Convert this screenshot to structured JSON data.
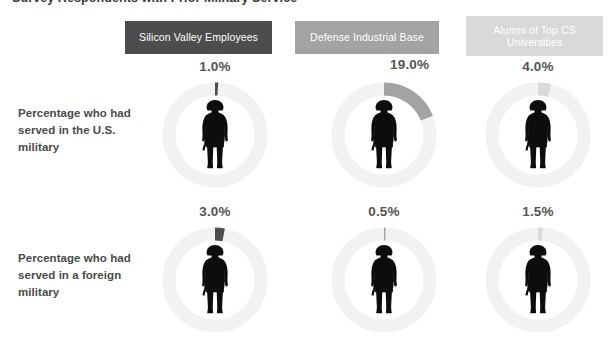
{
  "title": "Survey Respondents with Prior Military Service",
  "columns": [
    {
      "label": "Silicon Valley Employees",
      "color": "#4d4d4d"
    },
    {
      "label": "Defense Industrial Base",
      "color": "#a3a3a3"
    },
    {
      "label": "Alumni of Top CS Universities",
      "color": "#d9d9d9"
    }
  ],
  "rows": [
    {
      "label": "Percentage who had served in the U.S. military"
    },
    {
      "label": "Percentage who had served in a foreign military"
    }
  ],
  "cells": [
    {
      "value_label": "1.0%",
      "value": 1.0,
      "label_pos": "center"
    },
    {
      "value_label": "19.0%",
      "value": 19.0,
      "label_pos": "right"
    },
    {
      "value_label": "4.0%",
      "value": 4.0,
      "label_pos": "center"
    },
    {
      "value_label": "3.0%",
      "value": 3.0,
      "label_pos": "center"
    },
    {
      "value_label": "0.5%",
      "value": 0.5,
      "label_pos": "center"
    },
    {
      "value_label": "1.5%",
      "value": 1.5,
      "label_pos": "center"
    }
  ],
  "icon": "soldier-silhouette-icon",
  "track_color": "#f2f2f2",
  "background": "#ffffff",
  "chart_data": {
    "type": "pie",
    "title": "Survey Respondents with Prior Military Service",
    "xlabel": "",
    "ylabel": "",
    "unit": "percent",
    "grid": false,
    "legend": "top (column header chips)",
    "categories": [
      "Silicon Valley Employees",
      "Defense Industrial Base",
      "Alumni of Top CS Universities"
    ],
    "series": [
      {
        "name": "Percentage who had served in the U.S. military",
        "values": [
          1.0,
          19.0,
          4.0
        ],
        "value_labels": [
          "1.0%",
          "19.0%",
          "4.0%"
        ]
      },
      {
        "name": "Percentage who had served in a foreign military",
        "values": [
          3.0,
          0.5,
          1.5
        ],
        "value_labels": [
          "3.0%",
          "0.5%",
          "1.5%"
        ]
      }
    ],
    "series_colors": [
      "#4d4d4d",
      "#a3a3a3",
      "#d9d9d9"
    ],
    "track_color": "#f2f2f2",
    "ylim": [
      0,
      100
    ],
    "note": "Each cell is a donut gauge starting at 12 o'clock, filled clockwise by the percentage; centre holds a soldier silhouette icon."
  }
}
